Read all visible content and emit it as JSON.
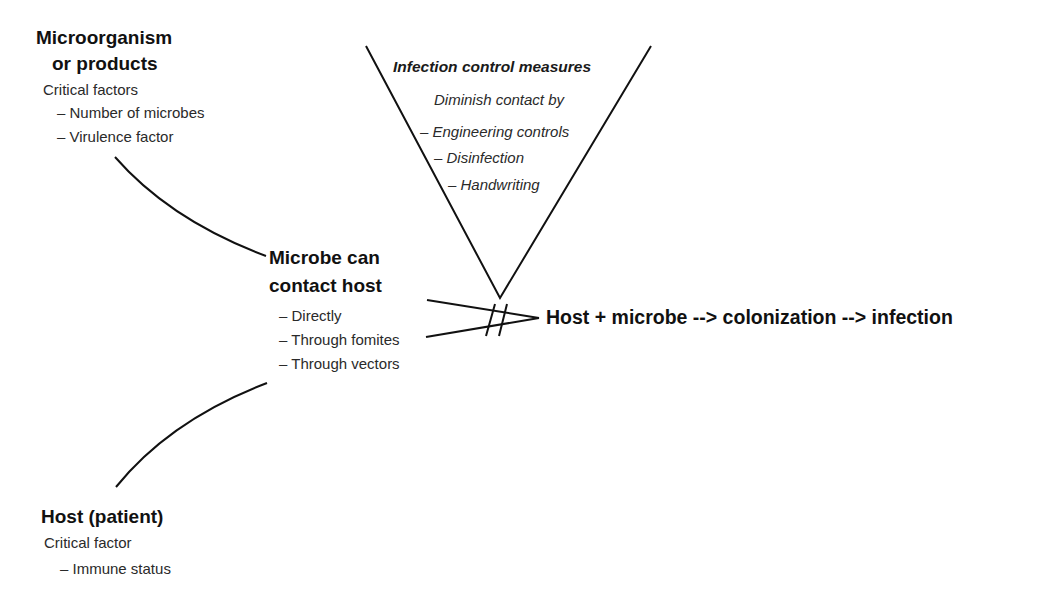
{
  "microorganism": {
    "title_line1": "Microorganism",
    "title_line2": "or products",
    "subtitle": "Critical factors",
    "items": [
      "– Number of microbes",
      "– Virulence factor"
    ]
  },
  "infection_control": {
    "title": "Infection control measures",
    "subtitle": "Diminish contact by",
    "items": [
      "– Engineering controls",
      "– Disinfection",
      "– Handwriting"
    ]
  },
  "contact": {
    "title_line1": "Microbe can",
    "title_line2": "contact host",
    "items": [
      "– Directly",
      "– Through fomites",
      "– Through vectors"
    ]
  },
  "outcome": {
    "text": "Host + microbe --> colonization --> infection"
  },
  "host": {
    "title": "Host (patient)",
    "subtitle": "Critical factor",
    "items": [
      "– Immune status"
    ]
  },
  "colors": {
    "line": "#111111",
    "text": "#1a1a1a",
    "background": "#ffffff"
  }
}
